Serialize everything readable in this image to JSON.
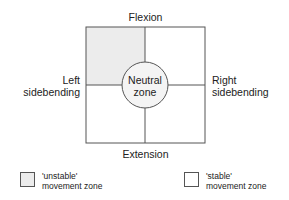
{
  "diagram": {
    "top_label": "Flexion",
    "bottom_label": "Extension",
    "left_label_line1": "Left",
    "left_label_line2": "sidebending",
    "right_label_line1": "Right",
    "right_label_line2": "sidebending",
    "center_label_line1": "Neutral",
    "center_label_line2": "zone",
    "colors": {
      "unstable_fill": "#ececec",
      "stable_fill": "#ffffff",
      "line": "#555555"
    }
  },
  "legend": {
    "items": [
      {
        "line1": "'unstable'",
        "line2": "movement zone",
        "fill": "#ececec"
      },
      {
        "line1": "'stable'",
        "line2": "movement zone",
        "fill": "#ffffff"
      }
    ]
  }
}
